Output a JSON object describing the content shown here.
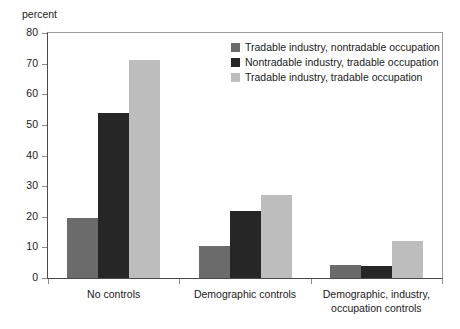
{
  "chart_data": {
    "type": "bar",
    "title": "",
    "subtitle": "",
    "xlabel": "",
    "ylabel": "percent",
    "ylim": [
      0,
      80
    ],
    "yticks": [
      0,
      10,
      20,
      30,
      40,
      50,
      60,
      70,
      80
    ],
    "grid": false,
    "legend_position": "top-right",
    "categories": [
      "No controls",
      "Demographic controls",
      "Demographic, industry,\noccupation controls"
    ],
    "series": [
      {
        "name": "Tradable industry, nontradable occupation",
        "color": "#6b6b6b",
        "values": [
          19.5,
          10.5,
          4.3
        ]
      },
      {
        "name": "Nontradable industry, tradable occupation",
        "color": "#262626",
        "values": [
          54.0,
          22.0,
          4.0
        ]
      },
      {
        "name": "Tradable industry, tradable occupation",
        "color": "#bdbdbd",
        "values": [
          71.3,
          27.0,
          12.0
        ]
      }
    ]
  },
  "axis": {
    "unit_caption": "percent",
    "tick_labels": [
      "0",
      "10",
      "20",
      "30",
      "40",
      "50",
      "60",
      "70",
      "80"
    ]
  },
  "category_labels": [
    {
      "line1": "No controls",
      "line2": ""
    },
    {
      "line1": "Demographic controls",
      "line2": ""
    },
    {
      "line1": "Demographic, industry,",
      "line2": "occupation controls"
    }
  ],
  "legend": {
    "items": [
      {
        "label": "Tradable industry, nontradable occupation",
        "color": "#6b6b6b"
      },
      {
        "label": "Nontradable industry, tradable occupation",
        "color": "#262626"
      },
      {
        "label": "Tradable industry, tradable occupation",
        "color": "#bdbdbd"
      }
    ]
  },
  "colors": {
    "series_1": "#6b6b6b",
    "series_2": "#262626",
    "series_3": "#bdbdbd",
    "axis_line": "#4a4a4a",
    "frame_line": "#9a9a9a",
    "text": "#1a1a1a",
    "background": "#ffffff"
  }
}
